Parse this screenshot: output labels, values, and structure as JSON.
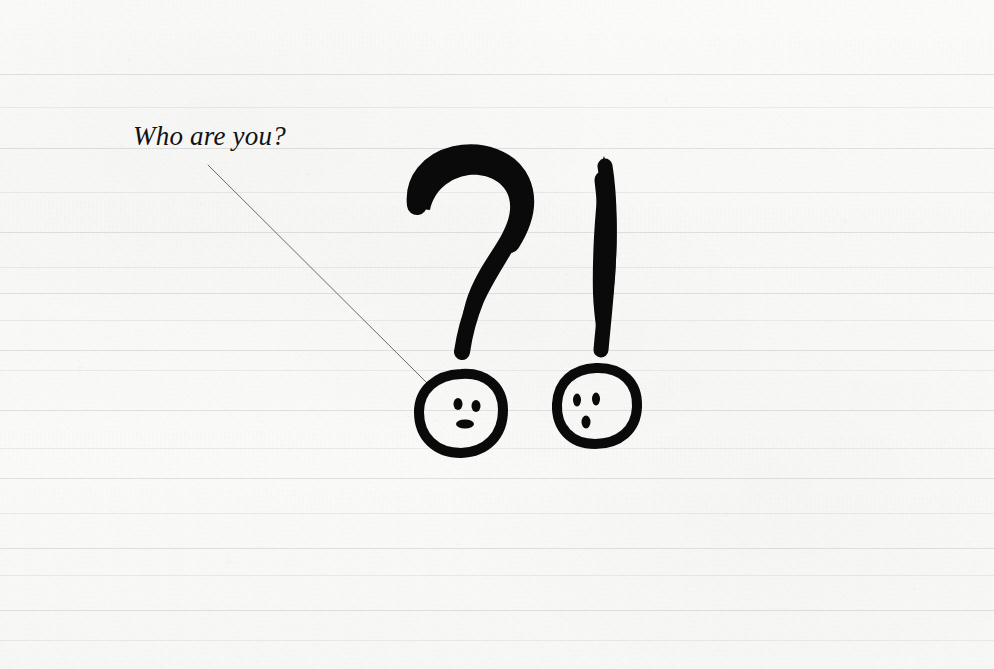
{
  "canvas": {
    "width": 994,
    "height": 669,
    "medium": "ink-brush-drawing-on-ruled-paper"
  },
  "paper": {
    "background_color": "#fafaf9",
    "rule_line_color": "#787c84",
    "rule_line_positions": [
      74,
      107,
      148,
      192,
      232,
      267,
      293,
      320,
      350,
      370,
      410,
      448,
      478,
      513,
      548,
      575,
      610,
      640
    ],
    "texture": "fibrous off-white sketchbook paper with faint mottling"
  },
  "annotation": {
    "caption_text": "Who are you?",
    "caption_color": "#121212",
    "leader_line": {
      "from_x": 208,
      "from_y": 165,
      "to_x": 427,
      "to_y": 383,
      "color": "#6a6a6a",
      "width": 1
    }
  },
  "artwork": {
    "ink_color": "#0a0a0a",
    "marks": [
      {
        "name": "question-mark",
        "description": "brush-drawn question mark hook and tapering tail",
        "bounds": {
          "x": 408,
          "y": 153,
          "width": 120,
          "height": 200
        }
      },
      {
        "name": "exclamation-mark",
        "description": "thick slightly curved tapering vertical brush stroke",
        "bounds": {
          "x": 592,
          "y": 155,
          "width": 26,
          "height": 198
        }
      }
    ],
    "faces": [
      {
        "name": "question-mark-face",
        "role": "dot of the question mark drawn as a face",
        "center_x": 460,
        "center_y": 413,
        "radius": 40,
        "expression": "neutral-smiling",
        "eyes": [
          {
            "cx": 458,
            "cy": 404,
            "rx": 4.5,
            "ry": 6
          },
          {
            "cx": 476,
            "cy": 406,
            "rx": 4.5,
            "ry": 6
          }
        ],
        "mouth": {
          "cx": 465,
          "cy": 424,
          "rx": 9,
          "ry": 4,
          "shape": "horizontal-bar"
        }
      },
      {
        "name": "exclamation-mark-face",
        "role": "dot of the exclamation mark drawn as a face",
        "center_x": 597,
        "center_y": 405,
        "radius": 40,
        "expression": "surprised",
        "eyes": [
          {
            "cx": 577,
            "cy": 400,
            "rx": 4,
            "ry": 6.5
          },
          {
            "cx": 596,
            "cy": 399,
            "rx": 4,
            "ry": 6.5
          }
        ],
        "mouth": {
          "cx": 586,
          "cy": 422,
          "rx": 4.5,
          "ry": 6.5,
          "shape": "small-oval"
        }
      }
    ]
  }
}
